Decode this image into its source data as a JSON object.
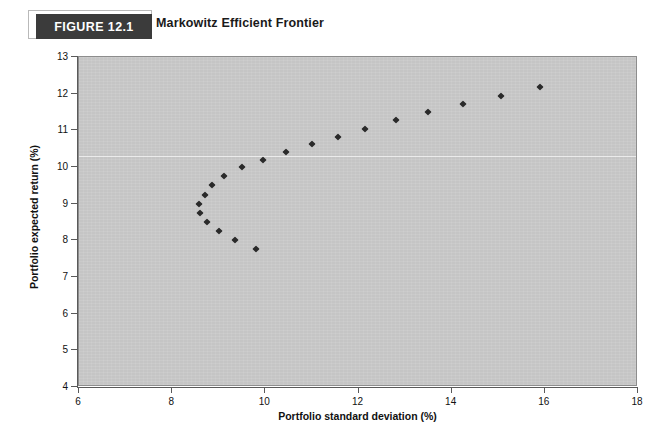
{
  "figure": {
    "badge_label": "FIGURE 12.1",
    "title": "Markowitz Efficient Frontier"
  },
  "chart_data": {
    "type": "scatter",
    "title": "Markowitz Efficient Frontier",
    "xlabel": "Portfolio standard deviation (%)",
    "ylabel": "Portfolio expected return (%)",
    "xlim": [
      6,
      18
    ],
    "ylim": [
      4,
      13
    ],
    "xticks": [
      6,
      8,
      10,
      12,
      14,
      16,
      18
    ],
    "yticks": [
      4,
      5,
      6,
      7,
      8,
      9,
      10,
      11,
      12,
      13
    ],
    "grid": false,
    "legend": null,
    "marker": "diamond",
    "marker_color": "#2a2a2a",
    "plot_background": "#c9c9c9",
    "points": [
      {
        "x": 8.7,
        "y": 9.25
      },
      {
        "x": 8.58,
        "y": 9.0
      },
      {
        "x": 8.6,
        "y": 8.75
      },
      {
        "x": 8.75,
        "y": 8.5
      },
      {
        "x": 9.0,
        "y": 8.25
      },
      {
        "x": 9.35,
        "y": 8.0
      },
      {
        "x": 9.8,
        "y": 7.77
      },
      {
        "x": 8.85,
        "y": 9.5
      },
      {
        "x": 9.12,
        "y": 9.75
      },
      {
        "x": 9.5,
        "y": 10.0
      },
      {
        "x": 9.95,
        "y": 10.2
      },
      {
        "x": 10.45,
        "y": 10.4
      },
      {
        "x": 11.0,
        "y": 10.62
      },
      {
        "x": 11.55,
        "y": 10.82
      },
      {
        "x": 12.15,
        "y": 11.05
      },
      {
        "x": 12.8,
        "y": 11.28
      },
      {
        "x": 13.5,
        "y": 11.5
      },
      {
        "x": 14.25,
        "y": 11.72
      },
      {
        "x": 15.05,
        "y": 11.95
      },
      {
        "x": 15.9,
        "y": 12.18
      }
    ]
  }
}
